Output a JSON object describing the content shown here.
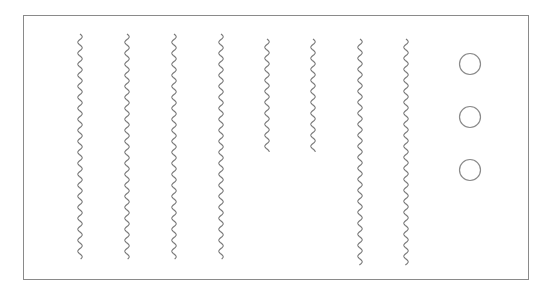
{
  "diagram": {
    "frame": {
      "x": 23,
      "y": 15,
      "width": 505,
      "height": 264,
      "stroke": "#8a8a8a"
    },
    "wavy_lines": [
      {
        "id": "line-1",
        "x": 80,
        "y1": 34,
        "y2": 259
      },
      {
        "id": "line-2",
        "x": 127,
        "y1": 34,
        "y2": 259
      },
      {
        "id": "line-3",
        "x": 174,
        "y1": 34,
        "y2": 259
      },
      {
        "id": "line-4",
        "x": 221,
        "y1": 34,
        "y2": 259
      },
      {
        "id": "line-5",
        "x": 267,
        "y1": 39,
        "y2": 152
      },
      {
        "id": "line-6",
        "x": 313,
        "y1": 39,
        "y2": 152
      },
      {
        "id": "line-7",
        "x": 360,
        "y1": 39,
        "y2": 265
      },
      {
        "id": "line-8",
        "x": 406,
        "y1": 39,
        "y2": 265
      }
    ],
    "circles": [
      {
        "id": "circle-1",
        "cx": 470,
        "cy": 64,
        "r": 10.5
      },
      {
        "id": "circle-2",
        "cx": 470,
        "cy": 117,
        "r": 10.5
      },
      {
        "id": "circle-3",
        "cx": 470,
        "cy": 170,
        "r": 10.5
      }
    ],
    "colors": {
      "line": "#7a7a7a",
      "circle": "#8a8a8a",
      "frame": "#8a8a8a",
      "background": "#ffffff"
    },
    "wave": {
      "amplitude": 2.2,
      "period": 11
    }
  }
}
